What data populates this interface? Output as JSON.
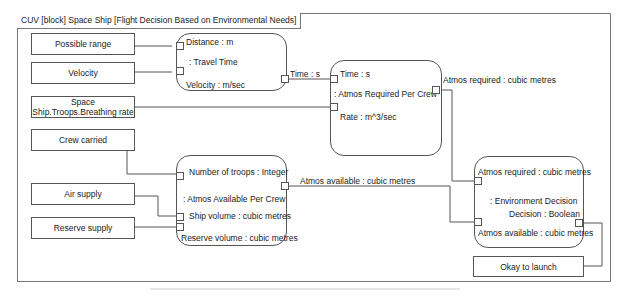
{
  "frame": {
    "title": "CUV [block] Space Ship [Flight Decision Based on Environmental Needs]"
  },
  "inputs": [
    {
      "id": "possible-range",
      "label": "Possible range"
    },
    {
      "id": "velocity",
      "label": "Velocity"
    },
    {
      "id": "breathing-rate",
      "label": "Space Ship.Troops.Breathing rate"
    },
    {
      "id": "crew-carried",
      "label": "Crew carried"
    },
    {
      "id": "air-supply",
      "label": "Air supply"
    },
    {
      "id": "reserve-supply",
      "label": "Reserve supply"
    }
  ],
  "output": {
    "label": "Okay to launch"
  },
  "blocks": {
    "travel_time": {
      "name": ": Travel Time",
      "params": {
        "distance": "Distance : m",
        "velocity": "Velocity : m/sec",
        "time": "Time : s"
      }
    },
    "atmos_required": {
      "name": ": Atmos Required Per Crew",
      "params": {
        "time": "Time : s",
        "rate": "Rate : m^3/sec",
        "atmos_required": "Atmos required : cubic metres"
      }
    },
    "atmos_available": {
      "name": ": Atmos Available Per Crew",
      "params": {
        "troops": "Number of troops : Integer",
        "ship_volume": "Ship volume : cubic metres",
        "reserve_volume": "Reserve volume : cubic metres",
        "atmos_available": "Atmos available : cubic metres"
      }
    },
    "environment_decision": {
      "name": ": Environment Decision",
      "params": {
        "atmos_required": "Atmos required : cubic metres",
        "decision": "Decision : Boolean",
        "atmos_available": "Atmos available : cubic metres"
      }
    }
  }
}
